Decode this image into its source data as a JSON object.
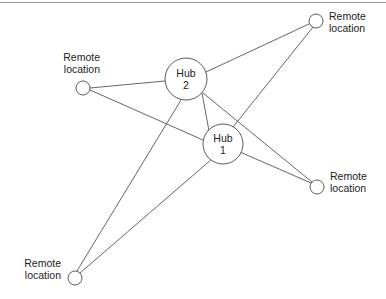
{
  "diagram": {
    "kind": "network-topology",
    "background_color": "#ffffff",
    "edge_color": "#555555",
    "node_stroke_color": "#4a4a4a",
    "text_color": "#1c1c1c",
    "frame_color": "#9a9a9a",
    "width": 386,
    "height": 299
  },
  "frame": {
    "top_rule_y": 2.5
  },
  "hubs": [
    {
      "id": "hub-2",
      "name_line1": "Hub",
      "name_line2": "2",
      "cx": 186,
      "cy": 79,
      "r": 21
    },
    {
      "id": "hub-1",
      "name_line1": "Hub",
      "name_line2": "1",
      "cx": 223,
      "cy": 144,
      "r": 20
    }
  ],
  "remotes": [
    {
      "id": "remote-top-right",
      "label_line1": "Remote",
      "label_line2": "location",
      "cx": 316,
      "cy": 21,
      "r": 7,
      "label_x": 329,
      "label_y1": 20,
      "label_y2": 32,
      "align": "start"
    },
    {
      "id": "remote-left",
      "label_line1": "Remote",
      "label_line2": "location",
      "cx": 83,
      "cy": 88,
      "r": 7,
      "label_x": 100,
      "label_y1": 61,
      "label_y2": 73,
      "align": "end"
    },
    {
      "id": "remote-right",
      "label_line1": "Remote",
      "label_line2": "location",
      "cx": 317,
      "cy": 187,
      "r": 7,
      "label_x": 330,
      "label_y1": 180,
      "label_y2": 192,
      "align": "start"
    },
    {
      "id": "remote-bottom-left",
      "label_line1": "Remote",
      "label_line2": "location",
      "cx": 75,
      "cy": 278,
      "r": 7,
      "label_x": 61,
      "label_y1": 267,
      "label_y2": 279,
      "align": "end"
    }
  ],
  "edges": [
    {
      "id": "edge-hub2-hub1",
      "from": "hub-2",
      "to": "hub-1",
      "x1": 202,
      "y1": 93,
      "x2": 209,
      "y2": 131
    },
    {
      "id": "edge-hub2-remote-topright",
      "from": "hub-2",
      "to": "remote-top-right",
      "x1": 206,
      "y1": 72,
      "x2": 309,
      "y2": 24
    },
    {
      "id": "edge-hub2-remote-left",
      "from": "hub-2",
      "to": "remote-left",
      "x1": 165,
      "y1": 81,
      "x2": 90,
      "y2": 88
    },
    {
      "id": "edge-hub2-remote-right",
      "from": "hub-2",
      "to": "remote-right",
      "x1": 203,
      "y1": 93,
      "x2": 312,
      "y2": 182
    },
    {
      "id": "edge-hub2-remote-botleft",
      "from": "hub-2",
      "to": "remote-bottom-left",
      "x1": 181,
      "y1": 100,
      "x2": 77,
      "y2": 271
    },
    {
      "id": "edge-hub1-remote-topright",
      "from": "hub-1",
      "to": "remote-top-right",
      "x1": 233,
      "y1": 127,
      "x2": 313,
      "y2": 27
    },
    {
      "id": "edge-hub1-remote-left",
      "from": "hub-1",
      "to": "remote-left",
      "x1": 203,
      "y1": 140,
      "x2": 90,
      "y2": 90
    },
    {
      "id": "edge-hub1-remote-right",
      "from": "hub-1",
      "to": "remote-right",
      "x1": 240,
      "y1": 152,
      "x2": 311,
      "y2": 183
    },
    {
      "id": "edge-hub1-remote-botleft",
      "from": "hub-1",
      "to": "remote-bottom-left",
      "x1": 212,
      "y1": 159,
      "x2": 80,
      "y2": 273
    }
  ]
}
